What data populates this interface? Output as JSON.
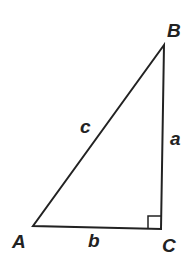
{
  "diagram": {
    "vertices": {
      "A": "A",
      "B": "B",
      "C": "C"
    },
    "sides": {
      "a": "a",
      "b": "b",
      "c": "c"
    },
    "right_angle_at": "C",
    "colors": {
      "stroke": "#222222",
      "background": "#ffffff"
    }
  }
}
